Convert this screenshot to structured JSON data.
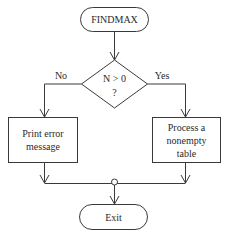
{
  "diagram": {
    "type": "flowchart",
    "start": {
      "label": "FINDMAX",
      "shape": "terminator"
    },
    "decision": {
      "line1": "N > 0",
      "line2": "?",
      "shape": "diamond"
    },
    "branches": {
      "no": {
        "label": "No",
        "box": {
          "lines": [
            "Print error",
            "message"
          ]
        }
      },
      "yes": {
        "label": "Yes",
        "box": {
          "lines": [
            "Process a",
            "nonempty",
            "table"
          ]
        }
      }
    },
    "junction": {
      "shape": "small-circle"
    },
    "end": {
      "label": "Exit",
      "shape": "terminator"
    },
    "colors": {
      "line": "#3a3a3a",
      "text": "#2a2a2a",
      "background": "#ffffff"
    }
  }
}
